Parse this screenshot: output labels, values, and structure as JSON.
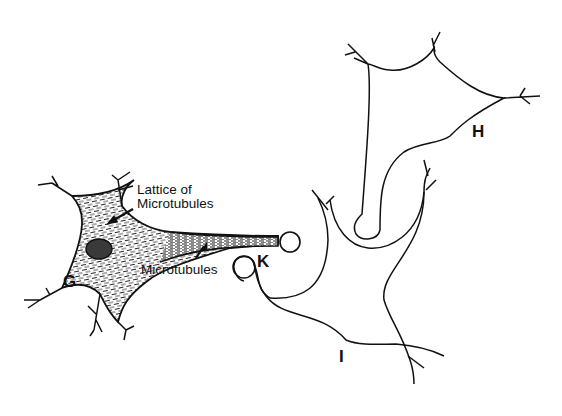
{
  "figure": {
    "colors": {
      "line": "#111111",
      "background": "#ffffff",
      "nucleus": "#3a3a3a"
    }
  },
  "labels": {
    "cell_g": "G",
    "cell_h": "H",
    "cell_i": "I",
    "terminal_k": "K",
    "lattice_line1": "Lattice of",
    "lattice_line2": "Microtubules",
    "microtubules": "Microtubules"
  }
}
